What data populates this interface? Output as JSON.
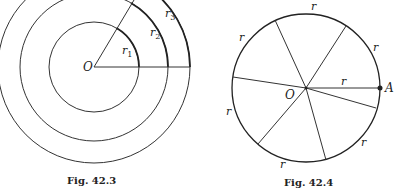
{
  "figures": [
    {
      "caption": "Fig. 42.3",
      "center_label": "O",
      "radius_labels": [
        "r",
        "r",
        "r"
      ],
      "radius_subscripts": [
        "1",
        "2",
        "3"
      ]
    },
    {
      "caption": "Fig. 42.4",
      "center_label": "O",
      "point_label": "A",
      "arc_label": "r",
      "radius_label": "r"
    }
  ],
  "colors": {
    "stroke": "#333333",
    "background": "#ffffff"
  }
}
